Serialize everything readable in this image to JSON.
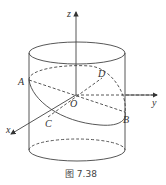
{
  "figure": {
    "caption": "图 7.38",
    "axes": {
      "x": "x",
      "y": "y",
      "z": "z"
    },
    "points": {
      "origin": "O",
      "A": "A",
      "B": "B",
      "C": "C",
      "D": "D"
    },
    "colors": {
      "stroke": "#444444",
      "background": "#ffffff"
    }
  }
}
